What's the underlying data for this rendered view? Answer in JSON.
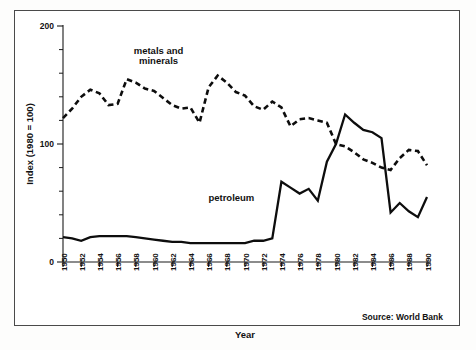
{
  "figure": {
    "source_note": "Source: World Bank"
  },
  "chart_data": {
    "type": "line",
    "title": "",
    "xlabel": "Year",
    "ylabel": "Index (1980 = 100)",
    "xlim": [
      1950,
      1990
    ],
    "ylim": [
      0,
      200
    ],
    "y_ticks": [
      0,
      100,
      200
    ],
    "y_tick_labels": [
      "0",
      "100",
      "200"
    ],
    "y_minor_tick_step": 20,
    "x_tick_step": 2,
    "grid": false,
    "legend": "inline-annotations",
    "x": [
      1950,
      1951,
      1952,
      1953,
      1954,
      1955,
      1956,
      1957,
      1958,
      1959,
      1960,
      1961,
      1962,
      1963,
      1964,
      1965,
      1966,
      1967,
      1968,
      1969,
      1970,
      1971,
      1972,
      1973,
      1974,
      1975,
      1976,
      1977,
      1978,
      1979,
      1980,
      1981,
      1982,
      1983,
      1984,
      1985,
      1986,
      1987,
      1988,
      1989,
      1990
    ],
    "x_tick_labels": [
      "1950",
      "1952",
      "1954",
      "1956",
      "1958",
      "1960",
      "1962",
      "1964",
      "1966",
      "1968",
      "1970",
      "1972",
      "1974",
      "1976",
      "1978",
      "1980",
      "1982",
      "1984",
      "1986",
      "1988",
      "1990"
    ],
    "series": [
      {
        "name": "metals and minerals",
        "style": "dashed",
        "label_x": 1960.5,
        "label_y": 176,
        "values": [
          122,
          130,
          140,
          146,
          143,
          133,
          134,
          155,
          152,
          147,
          145,
          139,
          133,
          130,
          131,
          118,
          148,
          158,
          152,
          144,
          141,
          132,
          129,
          136,
          131,
          115,
          121,
          122,
          120,
          118,
          100,
          98,
          93,
          87,
          84,
          80,
          78,
          88,
          95,
          94,
          82
        ]
      },
      {
        "name": "petroleum",
        "style": "solid",
        "label_x": 1968.5,
        "label_y": 52,
        "values": [
          21,
          20,
          18,
          21,
          22,
          22,
          22,
          22,
          21,
          20,
          19,
          18,
          17,
          17,
          16,
          16,
          16,
          16,
          16,
          16,
          16,
          18,
          18,
          20,
          68,
          63,
          58,
          62,
          52,
          85,
          100,
          125,
          118,
          112,
          110,
          105,
          42,
          50,
          43,
          38,
          55
        ]
      }
    ]
  }
}
